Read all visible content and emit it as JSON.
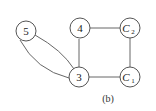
{
  "diagram": {
    "type": "graph",
    "caption": "(b)",
    "nodes": [
      {
        "id": "5",
        "label": "5",
        "sub": "",
        "italic": false
      },
      {
        "id": "4",
        "label": "4",
        "sub": "",
        "italic": false
      },
      {
        "id": "C2",
        "label": "C",
        "sub": "2",
        "italic": true
      },
      {
        "id": "3",
        "label": "3",
        "sub": "",
        "italic": false
      },
      {
        "id": "C1",
        "label": "C",
        "sub": "1",
        "italic": true
      }
    ],
    "edges": [
      {
        "from": "5",
        "to": "3",
        "kind": "curve-upper"
      },
      {
        "from": "5",
        "to": "3",
        "kind": "curve-lower"
      },
      {
        "from": "4",
        "to": "3",
        "kind": "straight"
      },
      {
        "from": "4",
        "to": "C2",
        "kind": "straight"
      },
      {
        "from": "C2",
        "to": "C1",
        "kind": "straight"
      },
      {
        "from": "3",
        "to": "C1",
        "kind": "straight"
      }
    ]
  }
}
